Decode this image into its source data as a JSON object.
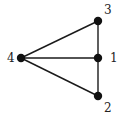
{
  "graph": {
    "nodes": [
      {
        "id": "1",
        "label": "1",
        "x": 98,
        "y": 58,
        "lx": 110,
        "ly": 62
      },
      {
        "id": "2",
        "label": "2",
        "x": 98,
        "y": 96,
        "lx": 104,
        "ly": 112
      },
      {
        "id": "3",
        "label": "3",
        "x": 98,
        "y": 21,
        "lx": 104,
        "ly": 14
      },
      {
        "id": "4",
        "label": "4",
        "x": 21,
        "y": 58,
        "lx": 7,
        "ly": 62
      }
    ],
    "edges": [
      [
        "4",
        "3"
      ],
      [
        "4",
        "1"
      ],
      [
        "4",
        "2"
      ],
      [
        "3",
        "1"
      ],
      [
        "1",
        "2"
      ]
    ]
  }
}
